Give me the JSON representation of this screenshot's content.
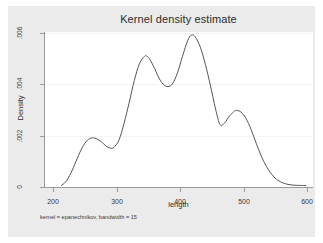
{
  "figure": {
    "title": "Kernel density estimate",
    "note": "kernel = epanechnikov, bandwidth = 15",
    "background": "#ebebeb",
    "plot_background": "#ffffff",
    "line_color": "#555555",
    "axis_color": "#9a9a9a"
  },
  "chart_data": {
    "type": "line",
    "title": "Kernel density estimate",
    "subtitle": "",
    "xlabel": "length",
    "ylabel": "Density",
    "annotation": "kernel = epanechnikov, bandwidth = 15",
    "xlim": [
      200,
      600
    ],
    "ylim": [
      0,
      0.006
    ],
    "xticks": [
      200,
      300,
      400,
      500,
      600
    ],
    "xtick_labels": [
      "200",
      "300",
      "400",
      "500",
      "600"
    ],
    "yticks": [
      0,
      0.002,
      0.004,
      0.006
    ],
    "ytick_labels": [
      "0",
      ".002",
      ".004",
      ".006"
    ],
    "grid": "horizontal-faint",
    "legend": "none",
    "series": [
      {
        "name": "Density",
        "x": [
          213,
          220,
          228,
          236,
          244,
          252,
          260,
          268,
          276,
          284,
          290,
          296,
          304,
          312,
          320,
          328,
          336,
          344,
          347,
          352,
          360,
          368,
          375,
          381,
          388,
          396,
          404,
          412,
          418,
          424,
          432,
          440,
          448,
          456,
          463,
          470,
          478,
          486,
          490,
          496,
          504,
          512,
          520,
          528,
          536,
          544,
          552,
          560,
          570,
          580,
          590,
          598
        ],
        "y": [
          8e-05,
          0.00022,
          0.00055,
          0.001,
          0.00145,
          0.00178,
          0.00192,
          0.0019,
          0.00178,
          0.0016,
          0.00153,
          0.00156,
          0.00185,
          0.0025,
          0.0033,
          0.00415,
          0.0048,
          0.00509,
          0.00511,
          0.005,
          0.00462,
          0.0042,
          0.00398,
          0.00392,
          0.00402,
          0.00445,
          0.0051,
          0.0057,
          0.00592,
          0.00585,
          0.00545,
          0.00478,
          0.00395,
          0.00305,
          0.00244,
          0.0025,
          0.00278,
          0.00297,
          0.00299,
          0.00293,
          0.00268,
          0.00225,
          0.00172,
          0.00122,
          0.00082,
          0.00052,
          0.00032,
          0.0002,
          0.00012,
          9e-05,
          8e-05,
          8e-05
        ]
      }
    ],
    "peaks": [
      {
        "x": 260,
        "y": 0.00192,
        "label": "left mode"
      },
      {
        "x": 347,
        "y": 0.00511,
        "label": "second mode"
      },
      {
        "x": 418,
        "y": 0.00592,
        "label": "global mode"
      },
      {
        "x": 490,
        "y": 0.00299,
        "label": "right mode"
      }
    ],
    "troughs": [
      {
        "x": 290,
        "y": 0.00153
      },
      {
        "x": 381,
        "y": 0.00392
      },
      {
        "x": 463,
        "y": 0.00244
      }
    ]
  }
}
